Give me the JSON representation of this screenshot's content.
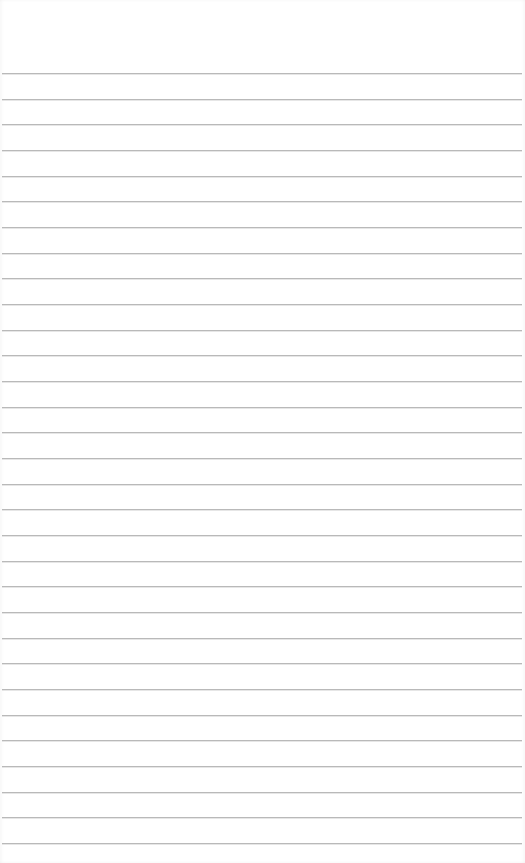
{
  "page": {
    "type": "lined-paper",
    "background_color": "#ffffff",
    "line_color": "#b9b9b9",
    "line_count": 31,
    "first_line_y": 73,
    "line_spacing": 25.67,
    "line_left": 2,
    "line_width": 520,
    "text": ""
  }
}
